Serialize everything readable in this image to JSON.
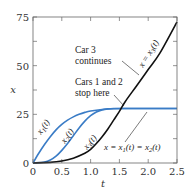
{
  "chart_data": {
    "type": "line",
    "title": "",
    "xlabel": "t",
    "ylabel": "x",
    "xlim": [
      0,
      2.5
    ],
    "ylim": [
      0,
      75
    ],
    "xticks": [
      "0",
      "0.5",
      "1.0",
      "1.5",
      "2.0",
      "2.5"
    ],
    "yticks": [
      "0",
      "25",
      "50",
      "75"
    ],
    "grid": false,
    "series": [
      {
        "name": "x1(t)",
        "color": "#3a7cc6",
        "x": [
          0,
          0.1,
          0.2,
          0.3,
          0.4,
          0.5,
          0.6,
          0.7,
          0.8,
          0.9,
          1.0,
          1.2,
          1.4,
          1.6,
          2.0,
          2.5
        ],
        "y": [
          0,
          5,
          9.5,
          13.5,
          17,
          19.8,
          22,
          23.7,
          25,
          26,
          26.7,
          27.5,
          27.9,
          28,
          28,
          28
        ]
      },
      {
        "name": "x2(t)",
        "color": "#3a7cc6",
        "x": [
          0,
          0.2,
          0.3,
          0.4,
          0.5,
          0.6,
          0.7,
          0.8,
          0.9,
          1.0,
          1.1,
          1.2,
          1.3,
          1.4,
          1.6,
          2.0,
          2.5
        ],
        "y": [
          0,
          0.5,
          1.5,
          3.5,
          6.5,
          10,
          14,
          18,
          21.5,
          24.3,
          26.2,
          27.3,
          27.8,
          28,
          28,
          28,
          28
        ]
      },
      {
        "name": "x3(t)",
        "color": "#111111",
        "x": [
          0,
          0.3,
          0.5,
          0.7,
          0.9,
          1.0,
          1.1,
          1.2,
          1.3,
          1.4,
          1.5,
          1.6,
          1.8,
          2.0,
          2.2,
          2.5
        ],
        "y": [
          0,
          0.3,
          1,
          2.5,
          5,
          7,
          10,
          13.5,
          17.5,
          22,
          26.5,
          31.5,
          39.7,
          48,
          56.3,
          72.5
        ]
      }
    ],
    "annotations": [
      {
        "text": "Car 3 continues",
        "points_to": [
          2.0,
          48
        ]
      },
      {
        "text": "Cars 1 and 2 stop here",
        "points_to": [
          1.6,
          28
        ]
      },
      {
        "text": "x = x3(t)"
      },
      {
        "text": "x = x1(t) = x2(t)",
        "points_to": [
          1.95,
          28
        ]
      }
    ]
  },
  "labels": {
    "x_axis": "t",
    "y_axis": "x",
    "curve1": "x",
    "curve1_sub": "1",
    "curve2": "x",
    "curve2_sub": "2",
    "curve3": "x",
    "curve3_sub": "3",
    "car3_line1": "Car 3",
    "car3_line2": "continues",
    "cars12_line1": "Cars 1 and 2",
    "cars12_line2": "stop here",
    "eq3": "x = x",
    "eq3_sub": "3",
    "eq3_tail": "(t)",
    "eq12_a": "x = x",
    "eq12_sub1": "1",
    "eq12_b": "(t) = x",
    "eq12_sub2": "2",
    "eq12_c": "(t)",
    "paren_t": "(t)"
  }
}
